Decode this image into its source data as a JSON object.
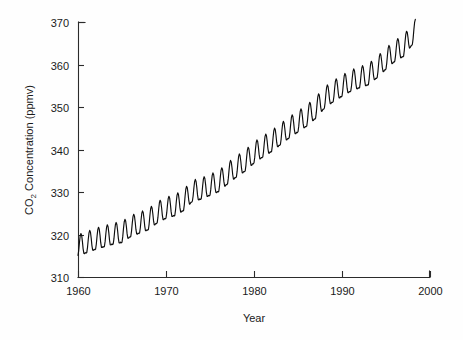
{
  "chart_data": {
    "type": "line",
    "title": "",
    "subtitle": "",
    "xlabel": "Year",
    "ylabel": "CO2 Concentration (ppmv)",
    "ylabel_prefix": "CO",
    "ylabel_sub": "2",
    "ylabel_suffix": " Concentration (ppmv)",
    "xlim": [
      1960,
      2000
    ],
    "ylim": [
      310,
      370
    ],
    "xticks": [
      1960,
      1970,
      1980,
      1990,
      2000
    ],
    "xtick_labels": [
      "1960",
      "1970",
      "1980",
      "1990",
      "2000"
    ],
    "yticks": [
      310,
      320,
      330,
      340,
      350,
      360,
      370
    ],
    "ytick_labels": [
      "310",
      "320",
      "330",
      "340",
      "350",
      "360",
      "370"
    ],
    "grid": false,
    "legend": "none",
    "line_color": "#0d0d0d",
    "background_color": "#fefefe",
    "axis_color": "#2b2b2b",
    "series": [
      {
        "name": "Monthly mean CO2 concentration",
        "x_start": 1960.0,
        "x_end": 1998.4,
        "sampling": "monthly",
        "annual_trend_ppmv": [
          {
            "year": 1960,
            "mean": 316.9
          },
          {
            "year": 1961,
            "mean": 317.6
          },
          {
            "year": 1962,
            "mean": 318.4
          },
          {
            "year": 1963,
            "mean": 319.0
          },
          {
            "year": 1964,
            "mean": 319.6
          },
          {
            "year": 1965,
            "mean": 320.0
          },
          {
            "year": 1966,
            "mean": 321.4
          },
          {
            "year": 1967,
            "mean": 322.2
          },
          {
            "year": 1968,
            "mean": 323.0
          },
          {
            "year": 1969,
            "mean": 324.6
          },
          {
            "year": 1970,
            "mean": 325.7
          },
          {
            "year": 1971,
            "mean": 326.3
          },
          {
            "year": 1972,
            "mean": 327.5
          },
          {
            "year": 1973,
            "mean": 329.7
          },
          {
            "year": 1974,
            "mean": 330.2
          },
          {
            "year": 1975,
            "mean": 331.1
          },
          {
            "year": 1976,
            "mean": 332.0
          },
          {
            "year": 1977,
            "mean": 333.8
          },
          {
            "year": 1978,
            "mean": 335.4
          },
          {
            "year": 1979,
            "mean": 336.8
          },
          {
            "year": 1980,
            "mean": 338.7
          },
          {
            "year": 1981,
            "mean": 340.1
          },
          {
            "year": 1982,
            "mean": 341.4
          },
          {
            "year": 1983,
            "mean": 343.0
          },
          {
            "year": 1984,
            "mean": 344.6
          },
          {
            "year": 1985,
            "mean": 346.0
          },
          {
            "year": 1986,
            "mean": 347.4
          },
          {
            "year": 1987,
            "mean": 349.2
          },
          {
            "year": 1988,
            "mean": 351.6
          },
          {
            "year": 1989,
            "mean": 353.1
          },
          {
            "year": 1990,
            "mean": 354.4
          },
          {
            "year": 1991,
            "mean": 355.6
          },
          {
            "year": 1992,
            "mean": 356.4
          },
          {
            "year": 1993,
            "mean": 357.1
          },
          {
            "year": 1994,
            "mean": 358.8
          },
          {
            "year": 1995,
            "mean": 360.8
          },
          {
            "year": 1996,
            "mean": 362.6
          },
          {
            "year": 1997,
            "mean": 363.8
          },
          {
            "year": 1998,
            "mean": 366.6
          }
        ],
        "seasonal_amplitude_ppmv": 3.1,
        "seasonal_peak_month": 5,
        "seasonal_trough_month": 10,
        "min_value": 313.9,
        "max_value": 367.2,
        "first_value": 317.1,
        "last_value": 362.0
      }
    ]
  },
  "geometry": {
    "plot_left": 78,
    "plot_right": 430,
    "plot_top": 22,
    "plot_bottom": 277
  }
}
